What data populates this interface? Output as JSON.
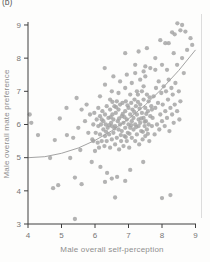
{
  "figure": {
    "panel_label": "(b)"
  },
  "chart_data": {
    "type": "scatter",
    "title": "",
    "xlabel": "Male overall self-perception",
    "ylabel": "Male overall mate preference",
    "xlim": [
      4,
      9
    ],
    "ylim": [
      3,
      9
    ],
    "x_ticks": [
      4,
      5,
      6,
      7,
      8,
      9
    ],
    "y_ticks": [
      3,
      4,
      5,
      6,
      7,
      8,
      9
    ],
    "grid": false,
    "legend": "none",
    "colors": {
      "point": "#a2a2a2",
      "axis": "#3f3f3f",
      "tick_label": "#767676",
      "axis_title": "#8e8e8e",
      "trend": "#999999",
      "panel_edge": "#dcdcdc",
      "background": "#fdfdfc"
    },
    "trend_line": [
      [
        4.0,
        5.0
      ],
      [
        4.5,
        5.03
      ],
      [
        5.0,
        5.13
      ],
      [
        5.5,
        5.29
      ],
      [
        6.0,
        5.52
      ],
      [
        6.5,
        5.81
      ],
      [
        7.0,
        6.17
      ],
      [
        7.5,
        6.59
      ],
      [
        8.0,
        7.08
      ],
      [
        8.5,
        7.63
      ],
      [
        9.0,
        8.25
      ]
    ],
    "points": [
      [
        4.05,
        6.3
      ],
      [
        4.1,
        6.05
      ],
      [
        4.3,
        5.68
      ],
      [
        4.66,
        4.99
      ],
      [
        4.8,
        5.53
      ],
      [
        4.95,
        6.18
      ],
      [
        5.15,
        6.5
      ],
      [
        5.16,
        5.68
      ],
      [
        5.26,
        4.99
      ],
      [
        5.45,
        6.8
      ],
      [
        5.56,
        5.23
      ],
      [
        5.35,
        5.6
      ],
      [
        5.5,
        5.9
      ],
      [
        5.6,
        6.45
      ],
      [
        5.7,
        6.1
      ],
      [
        5.75,
        6.6
      ],
      [
        5.8,
        5.75
      ],
      [
        5.85,
        6.3
      ],
      [
        5.9,
        4.87
      ],
      [
        5.95,
        5.5
      ],
      [
        4.75,
        4.08
      ],
      [
        4.9,
        4.17
      ],
      [
        5.4,
        3.15
      ],
      [
        5.4,
        4.4
      ],
      [
        5.6,
        4.2
      ],
      [
        6.3,
        4.27
      ],
      [
        6.5,
        4.37
      ],
      [
        6.6,
        3.8
      ],
      [
        6.9,
        4.3
      ],
      [
        8.0,
        3.78
      ],
      [
        8.25,
        3.87
      ],
      [
        6.16,
        4.72
      ],
      [
        6.36,
        4.54
      ],
      [
        6.66,
        4.42
      ],
      [
        7.05,
        4.63
      ],
      [
        7.44,
        4.87
      ],
      [
        5.92,
        5.55
      ],
      [
        5.95,
        6.0
      ],
      [
        5.98,
        6.35
      ],
      [
        6.0,
        5.2
      ],
      [
        6.02,
        5.75
      ],
      [
        6.05,
        6.15
      ],
      [
        6.08,
        5.45
      ],
      [
        6.1,
        5.95
      ],
      [
        6.1,
        6.5
      ],
      [
        6.12,
        5.3
      ],
      [
        6.15,
        5.7
      ],
      [
        6.15,
        6.25
      ],
      [
        6.18,
        6.0
      ],
      [
        6.2,
        5.5
      ],
      [
        6.22,
        6.4
      ],
      [
        6.25,
        5.85
      ],
      [
        6.25,
        6.1
      ],
      [
        6.28,
        5.35
      ],
      [
        6.3,
        5.65
      ],
      [
        6.3,
        6.3
      ],
      [
        6.32,
        6.0
      ],
      [
        6.35,
        5.5
      ],
      [
        6.35,
        6.55
      ],
      [
        6.38,
        5.9
      ],
      [
        6.4,
        6.2
      ],
      [
        6.42,
        5.7
      ],
      [
        6.45,
        6.45
      ],
      [
        6.45,
        5.3
      ],
      [
        6.48,
        6.05
      ],
      [
        6.5,
        5.55
      ],
      [
        6.5,
        5.95
      ],
      [
        6.52,
        6.3
      ],
      [
        6.55,
        5.75
      ],
      [
        6.55,
        6.15
      ],
      [
        6.58,
        6.55
      ],
      [
        6.6,
        5.4
      ],
      [
        6.6,
        5.95
      ],
      [
        6.62,
        6.35
      ],
      [
        6.65,
        5.6
      ],
      [
        6.65,
        6.7
      ],
      [
        6.68,
        6.1
      ],
      [
        6.7,
        5.85
      ],
      [
        6.7,
        6.45
      ],
      [
        6.72,
        5.25
      ],
      [
        6.75,
        6.0
      ],
      [
        6.75,
        6.6
      ],
      [
        6.78,
        5.5
      ],
      [
        6.8,
        5.8
      ],
      [
        6.8,
        6.25
      ],
      [
        6.82,
        6.65
      ],
      [
        6.85,
        5.35
      ],
      [
        6.85,
        6.05
      ],
      [
        6.88,
        5.65
      ],
      [
        6.9,
        6.4
      ],
      [
        6.9,
        5.9
      ],
      [
        6.92,
        6.7
      ],
      [
        6.95,
        5.5
      ],
      [
        6.95,
        6.15
      ],
      [
        6.98,
        5.75
      ],
      [
        7.0,
        6.0
      ],
      [
        7.0,
        6.5
      ],
      [
        7.02,
        5.3
      ],
      [
        7.05,
        5.9
      ],
      [
        7.05,
        6.3
      ],
      [
        7.08,
        6.65
      ],
      [
        7.1,
        5.6
      ],
      [
        7.1,
        6.1
      ],
      [
        7.12,
        6.45
      ],
      [
        7.15,
        5.85
      ],
      [
        7.15,
        6.2
      ],
      [
        7.18,
        6.75
      ],
      [
        7.2,
        5.5
      ],
      [
        7.2,
        6.0
      ],
      [
        7.22,
        6.55
      ],
      [
        7.25,
        5.7
      ],
      [
        7.25,
        6.3
      ],
      [
        7.28,
        6.9
      ],
      [
        7.3,
        5.95
      ],
      [
        7.3,
        6.15
      ],
      [
        7.32,
        5.4
      ],
      [
        7.35,
        6.6
      ],
      [
        7.35,
        6.05
      ],
      [
        7.38,
        5.8
      ],
      [
        7.4,
        6.35
      ],
      [
        7.4,
        7.0
      ],
      [
        7.42,
        5.55
      ],
      [
        7.45,
        6.2
      ],
      [
        7.45,
        6.75
      ],
      [
        7.48,
        5.95
      ],
      [
        7.5,
        6.5
      ],
      [
        7.5,
        5.65
      ],
      [
        7.52,
        6.1
      ],
      [
        7.55,
        6.9
      ],
      [
        7.55,
        5.85
      ],
      [
        7.58,
        6.4
      ],
      [
        7.6,
        6.0
      ],
      [
        7.6,
        6.7
      ],
      [
        7.62,
        5.5
      ],
      [
        7.65,
        6.25
      ],
      [
        7.68,
        6.55
      ],
      [
        7.7,
        5.95
      ],
      [
        7.7,
        6.45
      ],
      [
        6.15,
        6.85
      ],
      [
        6.3,
        7.2
      ],
      [
        6.29,
        7.7
      ],
      [
        6.5,
        7.0
      ],
      [
        6.55,
        7.45
      ],
      [
        6.7,
        6.95
      ],
      [
        6.75,
        7.3
      ],
      [
        6.9,
        7.1
      ],
      [
        6.95,
        7.5
      ],
      [
        7.05,
        6.9
      ],
      [
        7.1,
        7.25
      ],
      [
        7.2,
        7.55
      ],
      [
        7.25,
        7.0
      ],
      [
        7.35,
        7.35
      ],
      [
        7.45,
        7.15
      ],
      [
        7.5,
        7.45
      ],
      [
        6.45,
        6.75
      ],
      [
        7.72,
        6.2
      ],
      [
        7.75,
        6.85
      ],
      [
        7.78,
        5.7
      ],
      [
        7.8,
        6.5
      ],
      [
        7.82,
        7.1
      ],
      [
        7.85,
        6.0
      ],
      [
        7.88,
        6.65
      ],
      [
        7.9,
        7.3
      ],
      [
        7.92,
        5.85
      ],
      [
        7.95,
        6.3
      ],
      [
        7.98,
        6.95
      ],
      [
        8.0,
        6.1
      ],
      [
        8.02,
        6.6
      ],
      [
        8.05,
        7.15
      ],
      [
        8.08,
        5.95
      ],
      [
        8.1,
        6.4
      ],
      [
        8.12,
        7.0
      ],
      [
        8.15,
        6.2
      ],
      [
        8.18,
        6.75
      ],
      [
        8.2,
        7.35
      ],
      [
        8.22,
        5.8
      ],
      [
        8.25,
        6.5
      ],
      [
        8.28,
        7.1
      ],
      [
        8.3,
        6.3
      ],
      [
        8.32,
        6.9
      ],
      [
        8.35,
        6.05
      ],
      [
        8.38,
        6.6
      ],
      [
        8.4,
        7.25
      ],
      [
        8.45,
        6.4
      ],
      [
        8.5,
        7.0
      ],
      [
        8.52,
        6.15
      ],
      [
        8.55,
        6.7
      ],
      [
        8.46,
        9.05
      ],
      [
        8.6,
        9.0
      ],
      [
        8.55,
        8.84
      ],
      [
        8.3,
        8.78
      ],
      [
        7.95,
        8.54
      ],
      [
        8.1,
        8.45
      ],
      [
        8.85,
        8.6
      ],
      [
        8.7,
        8.8
      ],
      [
        8.38,
        8.72
      ],
      [
        7.3,
        8.2
      ],
      [
        7.8,
        8.0
      ],
      [
        8.35,
        8.15
      ],
      [
        8.6,
        8.0
      ],
      [
        8.2,
        8.45
      ],
      [
        6.9,
        8.15
      ],
      [
        8.9,
        8.4
      ],
      [
        8.75,
        8.25
      ],
      [
        7.5,
        7.75
      ],
      [
        7.65,
        7.7
      ],
      [
        7.8,
        7.65
      ],
      [
        7.45,
        7.6
      ],
      [
        7.2,
        7.8
      ],
      [
        7.55,
        8.3
      ],
      [
        8.0,
        7.8
      ],
      [
        8.15,
        7.65
      ],
      [
        8.45,
        7.8
      ],
      [
        8.65,
        7.55
      ],
      [
        6.2,
        6.15
      ],
      [
        6.33,
        5.78
      ],
      [
        6.47,
        6.22
      ],
      [
        6.58,
        5.88
      ],
      [
        6.63,
        6.52
      ],
      [
        6.77,
        5.68
      ],
      [
        6.83,
        6.32
      ],
      [
        6.97,
        6.58
      ],
      [
        7.03,
        5.72
      ],
      [
        7.17,
        6.38
      ],
      [
        7.23,
        5.92
      ],
      [
        7.33,
        6.48
      ],
      [
        7.43,
        5.78
      ],
      [
        7.53,
        6.32
      ],
      [
        7.63,
        6.82
      ],
      [
        6.88,
        6.22
      ],
      [
        7.08,
        5.98
      ],
      [
        7.28,
        6.68
      ],
      [
        7.48,
        6.08
      ],
      [
        7.58,
        5.72
      ],
      [
        6.42,
        5.98
      ],
      [
        6.52,
        6.68
      ],
      [
        6.72,
        6.18
      ],
      [
        6.92,
        5.62
      ],
      [
        7.38,
        6.18
      ]
    ]
  }
}
